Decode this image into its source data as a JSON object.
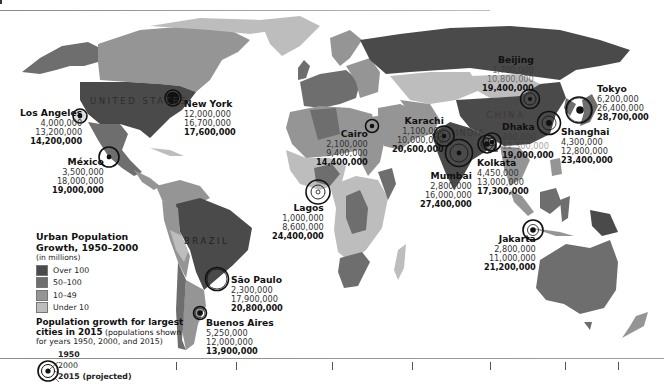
{
  "map": {
    "country_labels": {
      "united_states": "UNITED STATES",
      "china": "CHINA",
      "india": "INDIA",
      "brazil": "BRAZIL"
    },
    "colors": {
      "over_100": "#4a4a4a",
      "50_100": "#6e6e6e",
      "10_49": "#959595",
      "under_10": "#bdbdbd",
      "water": "#ffffff"
    },
    "cities": [
      {
        "name": "Los Angeles",
        "pop_1950": "4,000,000",
        "pop_2000": "13,200,000",
        "pop_2015": "14,200,000"
      },
      {
        "name": "New York",
        "pop_1950": "12,000,000",
        "pop_2000": "16,700,000",
        "pop_2015": "17,600,000"
      },
      {
        "name": "México",
        "pop_1950": "3,500,000",
        "pop_2000": "18,000,000",
        "pop_2015": "19,000,000"
      },
      {
        "name": "São Paulo",
        "pop_1950": "2,300,000",
        "pop_2000": "17,900,000",
        "pop_2015": "20,800,000"
      },
      {
        "name": "Buenos Aires",
        "pop_1950": "5,250,000",
        "pop_2000": "12,000,000",
        "pop_2015": "13,900,000"
      },
      {
        "name": "Lagos",
        "pop_1950": "1,000,000",
        "pop_2000": "8,600,000",
        "pop_2015": "24,400,000"
      },
      {
        "name": "Cairo",
        "pop_1950": "2,100,000",
        "pop_2000": "9,400,000",
        "pop_2015": "14,400,000"
      },
      {
        "name": "Karachi",
        "pop_1950": "1,100,000",
        "pop_2000": "10,000,000",
        "pop_2015": "20,600,000"
      },
      {
        "name": "Mumbai",
        "pop_1950": "2,800,000",
        "pop_2000": "16,000,000",
        "pop_2015": "27,400,000"
      },
      {
        "name": "Kolkata",
        "pop_1950": "4,450,000",
        "pop_2000": "13,000,000",
        "pop_2015": "17,300,000"
      },
      {
        "name": "Dhaka",
        "pop_1950": "400,000",
        "pop_2000": "12,300,000",
        "pop_2015": "19,000,000"
      },
      {
        "name": "Beijing",
        "pop_1950": "1,700,000",
        "pop_2000": "10,800,000",
        "pop_2015": "19,400,000"
      },
      {
        "name": "Shanghai",
        "pop_1950": "4,300,000",
        "pop_2000": "12,800,000",
        "pop_2015": "23,400,000"
      },
      {
        "name": "Tokyo",
        "pop_1950": "6,200,000",
        "pop_2000": "26,400,000",
        "pop_2015": "28,700,000"
      },
      {
        "name": "Jakarta",
        "pop_1950": "2,800,000",
        "pop_2000": "11,000,000",
        "pop_2015": "21,200,000"
      }
    ]
  },
  "legend": {
    "title_line1": "Urban Population",
    "title_line2": "Growth, 1950–2000",
    "subtitle": "(in millions)",
    "items": [
      {
        "label": "Over 100",
        "color": "#4a4a4a"
      },
      {
        "label": "50–100",
        "color": "#6e6e6e"
      },
      {
        "label": "10–49",
        "color": "#959595"
      },
      {
        "label": "Under 10",
        "color": "#bdbdbd"
      }
    ],
    "growth_title_bold_1": "Population growth for largest",
    "growth_title_bold_2": "cities in 2015",
    "growth_title_normal": " (populations shown",
    "growth_subtitle": "for years 1950, 2000, and 2015)",
    "ring_labels": {
      "inner": "1950",
      "middle": "2000",
      "outer": "2015 (projected)"
    }
  }
}
